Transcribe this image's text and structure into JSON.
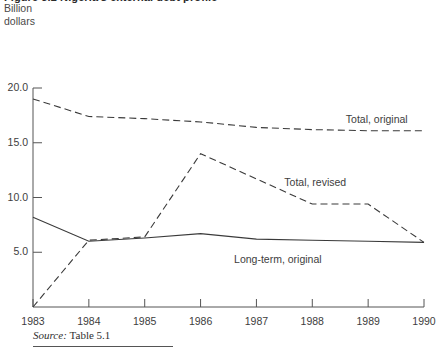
{
  "figure": {
    "title": "Figure 5.2  Nigeria's external debt profile",
    "unit_caption": "Billion\ndollars",
    "source_prefix": "Source:",
    "source_text": "Table 5.1"
  },
  "chart_data": {
    "type": "line",
    "title": "Figure 5.2  Nigeria's external debt profile",
    "xlabel": "",
    "ylabel": "Billion dollars",
    "x": [
      1983,
      1984,
      1985,
      1986,
      1987,
      1988,
      1989,
      1990
    ],
    "categories": [
      "1983",
      "1984",
      "1985",
      "1986",
      "1987",
      "1988",
      "1989",
      "1990"
    ],
    "xlim": [
      1983,
      1990
    ],
    "ylim": [
      0,
      21.8
    ],
    "yticks": [
      5.0,
      10.0,
      15.0,
      20.0
    ],
    "ytick_labels": [
      "5.0",
      "10.0",
      "15.0",
      "20.0"
    ],
    "xticks": [
      1983,
      1984,
      1985,
      1986,
      1987,
      1988,
      1989,
      1990
    ],
    "grid": false,
    "legend": "inline-annotations",
    "series": [
      {
        "name": "Total, original",
        "style": "dashed",
        "values": [
          19.0,
          17.4,
          17.2,
          16.9,
          16.4,
          16.2,
          16.1,
          16.1
        ],
        "label": "Total, original",
        "label_x": 1988.6,
        "label_y": 17.1
      },
      {
        "name": "Total, revised",
        "style": "dashed",
        "values": [
          0.0,
          6.1,
          6.4,
          14.0,
          11.7,
          9.4,
          9.4,
          5.9
        ],
        "label": "Total, revised",
        "label_x": 1987.5,
        "label_y": 11.3
      },
      {
        "name": "Long-term, original",
        "style": "solid",
        "values": [
          8.2,
          6.0,
          6.3,
          6.7,
          6.2,
          6.1,
          6.0,
          5.9
        ],
        "label": "Long-term, original",
        "label_x": 1986.6,
        "label_y": 4.3
      }
    ]
  }
}
